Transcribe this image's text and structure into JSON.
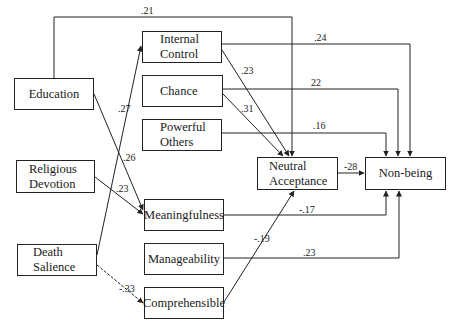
{
  "nodes": {
    "education": "Education",
    "religious_devotion": "Religious\nDevotion",
    "death_salience": "Death\nSalience",
    "internal_control": "Internal\nControl",
    "chance": "Chance",
    "powerful_others": "Powerful\nOthers",
    "meaningfulness": "Meaningfulness",
    "manageability": "Manageability",
    "comprehensible": "Comprehensible",
    "neutral_acceptance": "Neutral\nAcceptance",
    "non_being": "Non-being"
  },
  "paths": {
    "education_to_neutral": ".21",
    "internal_control_to_nonbeing": ".24",
    "chance_to_nonbeing": "22",
    "powerful_others_to_nonbeing": ".16",
    "internal_control_to_neutral": ".23",
    "chance_to_neutral": ".31",
    "death_salience_to_internal_control": ".27",
    "education_to_meaningfulness": ".26",
    "religious_devotion_to_meaningfulness": ".23",
    "neutral_to_nonbeing": "-28",
    "meaningfulness_to_nonbeing": "-.17",
    "comprehensible_to_neutral": "-.19",
    "manageability_to_nonbeing": ".23",
    "death_salience_to_comprehensible": "-.33"
  }
}
